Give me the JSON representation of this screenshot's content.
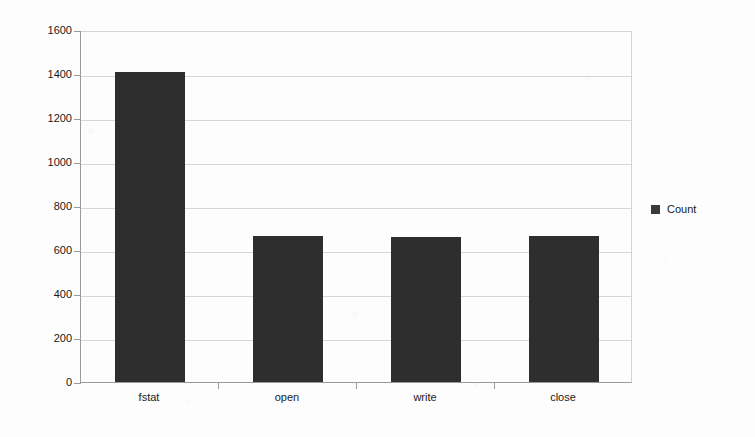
{
  "chart_data": {
    "type": "bar",
    "title": "",
    "xlabel": "",
    "ylabel": "",
    "categories": [
      "fstat",
      "open",
      "write",
      "close"
    ],
    "values": [
      1408,
      665,
      660,
      665
    ],
    "series": [
      {
        "name": "Count",
        "values": [
          1408,
          665,
          660,
          665
        ]
      }
    ],
    "ylim": [
      0,
      1600
    ],
    "y_ticks": [
      0,
      200,
      400,
      600,
      800,
      1000,
      1200,
      1400,
      1600
    ],
    "y_tick_labels": [
      "0",
      "200",
      "400",
      "600",
      "800",
      "1000",
      "1200",
      "1400",
      "1600"
    ],
    "grid": true,
    "legend_position": "right",
    "bar_color": "#2e2e2e",
    "gridline_color": "#d6d6d6",
    "axis_color": "#9a9a9a",
    "background_color": "#fdfdfd"
  },
  "legend": {
    "entries": [
      {
        "label": "Count",
        "color": "#3a3a3a"
      }
    ]
  }
}
